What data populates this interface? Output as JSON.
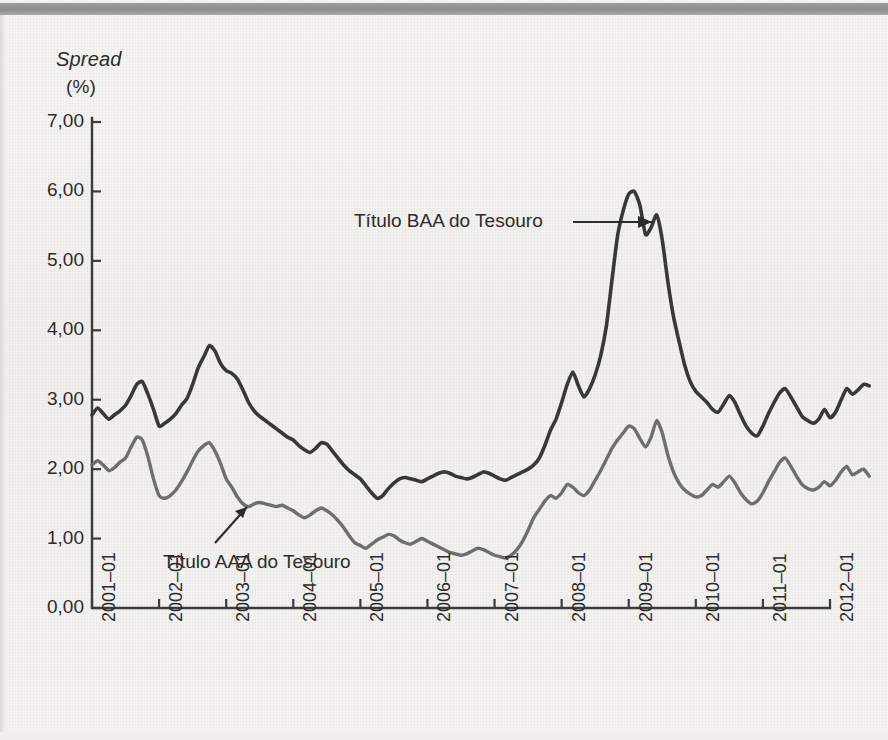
{
  "figure": {
    "ylabel_line1": "Spread",
    "ylabel_line2": "(%)",
    "background_color": "#f3f2f0",
    "topbar_color": "#8d8d8d"
  },
  "annotations": {
    "baa": {
      "text": "Título BAA do Tesouro",
      "arrow": "arrow-right"
    },
    "aaa": {
      "text": "Título AAA do Tesouro",
      "arrow": "arrow-up-right"
    }
  },
  "chart_data": {
    "type": "line",
    "title": "",
    "xlabel": "",
    "ylabel": "Spread (%)",
    "ylim": [
      0,
      7
    ],
    "yticks": [
      0,
      1,
      2,
      3,
      4,
      5,
      6,
      7
    ],
    "ytick_labels": [
      "0,00",
      "1,00",
      "2,00",
      "3,00",
      "4,00",
      "5,00",
      "6,00",
      "7,00"
    ],
    "xtick_labels": [
      "2001–01",
      "2002–01",
      "2003–01",
      "2004–01",
      "2005–01",
      "2006–01",
      "2007–01",
      "2008–01",
      "2009–01",
      "2010–01",
      "2011–01",
      "2012–01"
    ],
    "x_start": "2001-01",
    "x_end": "2012-03",
    "grid": false,
    "legend_position": "annotations-inline",
    "series": [
      {
        "name": "Título BAA do Tesouro",
        "color": "#383838",
        "width": 3.6,
        "values": [
          2.78,
          2.88,
          2.8,
          2.72,
          2.78,
          2.84,
          2.92,
          3.06,
          3.22,
          3.26,
          3.08,
          2.86,
          2.62,
          2.66,
          2.72,
          2.8,
          2.92,
          3.02,
          3.22,
          3.46,
          3.62,
          3.78,
          3.7,
          3.52,
          3.42,
          3.38,
          3.3,
          3.14,
          2.96,
          2.84,
          2.76,
          2.7,
          2.64,
          2.58,
          2.52,
          2.46,
          2.42,
          2.34,
          2.28,
          2.24,
          2.3,
          2.38,
          2.36,
          2.26,
          2.16,
          2.06,
          1.98,
          1.92,
          1.86,
          1.76,
          1.66,
          1.58,
          1.62,
          1.72,
          1.8,
          1.86,
          1.88,
          1.86,
          1.84,
          1.82,
          1.86,
          1.9,
          1.94,
          1.96,
          1.94,
          1.9,
          1.88,
          1.86,
          1.88,
          1.92,
          1.96,
          1.94,
          1.9,
          1.86,
          1.84,
          1.88,
          1.92,
          1.96,
          2.0,
          2.06,
          2.16,
          2.34,
          2.56,
          2.72,
          2.96,
          3.22,
          3.4,
          3.2,
          3.04,
          3.16,
          3.36,
          3.64,
          4.06,
          4.72,
          5.36,
          5.72,
          5.96,
          6.0,
          5.8,
          5.38,
          5.48,
          5.66,
          5.3,
          4.7,
          4.2,
          3.84,
          3.5,
          3.26,
          3.12,
          3.04,
          2.96,
          2.86,
          2.82,
          2.94,
          3.06,
          2.96,
          2.78,
          2.62,
          2.52,
          2.48,
          2.62,
          2.8,
          2.96,
          3.1,
          3.16,
          3.04,
          2.9,
          2.76,
          2.7,
          2.66,
          2.72,
          2.86,
          2.74,
          2.82,
          3.0,
          3.16,
          3.08,
          3.14,
          3.22,
          3.2
        ]
      },
      {
        "name": "Título AAA do Tesouro",
        "color": "#6e6e6e",
        "width": 3.4,
        "values": [
          2.06,
          2.12,
          2.06,
          1.98,
          2.02,
          2.1,
          2.16,
          2.32,
          2.46,
          2.42,
          2.18,
          1.86,
          1.62,
          1.58,
          1.62,
          1.7,
          1.82,
          1.96,
          2.12,
          2.26,
          2.34,
          2.38,
          2.26,
          2.08,
          1.86,
          1.74,
          1.6,
          1.5,
          1.46,
          1.5,
          1.52,
          1.5,
          1.48,
          1.46,
          1.48,
          1.44,
          1.4,
          1.34,
          1.3,
          1.34,
          1.4,
          1.44,
          1.4,
          1.34,
          1.26,
          1.16,
          1.04,
          0.94,
          0.9,
          0.86,
          0.92,
          0.98,
          1.02,
          1.06,
          1.04,
          0.98,
          0.94,
          0.92,
          0.96,
          1.0,
          0.96,
          0.92,
          0.88,
          0.84,
          0.8,
          0.78,
          0.76,
          0.78,
          0.82,
          0.86,
          0.84,
          0.8,
          0.76,
          0.74,
          0.72,
          0.76,
          0.84,
          0.96,
          1.12,
          1.3,
          1.42,
          1.54,
          1.62,
          1.58,
          1.66,
          1.78,
          1.74,
          1.66,
          1.62,
          1.7,
          1.84,
          1.98,
          2.14,
          2.3,
          2.42,
          2.52,
          2.62,
          2.58,
          2.44,
          2.32,
          2.46,
          2.7,
          2.52,
          2.2,
          1.96,
          1.8,
          1.7,
          1.64,
          1.6,
          1.62,
          1.7,
          1.78,
          1.74,
          1.82,
          1.9,
          1.8,
          1.66,
          1.56,
          1.5,
          1.54,
          1.66,
          1.82,
          1.96,
          2.1,
          2.16,
          2.04,
          1.9,
          1.78,
          1.72,
          1.7,
          1.74,
          1.82,
          1.76,
          1.84,
          1.96,
          2.04,
          1.92,
          1.96,
          2.0,
          1.9
        ]
      }
    ]
  }
}
